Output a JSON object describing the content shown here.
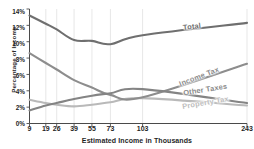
{
  "chart_data": {
    "type": "line",
    "title": "",
    "xlabel": "Estimated Income in Thousands",
    "ylabel": "Percentage of Income",
    "x": [
      9,
      19,
      26,
      39,
      55,
      73,
      103,
      243
    ],
    "xtick_labels": [
      "9",
      "19",
      "26",
      "39",
      "55",
      "73",
      "103",
      "243"
    ],
    "ytick_labels": [
      "0%",
      "2%",
      "4%",
      "6%",
      "8%",
      "10%",
      "12%",
      "14%"
    ],
    "ylim": [
      0,
      14
    ],
    "ytick_values": [
      0,
      2,
      4,
      6,
      8,
      10,
      12,
      14
    ],
    "grid": "vertical",
    "legend": "inline-series-labels",
    "series": [
      {
        "name": "Total",
        "color": "#6f6f6f",
        "values": [
          13.2,
          12.2,
          11.5,
          10.2,
          10.1,
          9.7,
          10.8,
          12.3
        ],
        "label_text": "Total"
      },
      {
        "name": "Income Tax",
        "color": "#8d8d8d",
        "values": [
          8.6,
          7.4,
          6.6,
          5.3,
          4.4,
          3.5,
          3.2,
          7.3
        ],
        "label_text": "Income Tax"
      },
      {
        "name": "Other Taxes",
        "color": "#848484",
        "values": [
          1.6,
          2.2,
          2.5,
          3.0,
          3.4,
          3.7,
          4.2,
          2.5
        ],
        "label_text": "Other Taxes"
      },
      {
        "name": "Property Tax",
        "color": "#b9b9b9",
        "values": [
          2.9,
          2.5,
          2.3,
          2.1,
          2.3,
          2.6,
          3.1,
          2.2
        ],
        "label_text": "Property Tax"
      }
    ]
  },
  "axis": {
    "ylabel": "Percentage of Income",
    "xlabel": "Estimated Income in Thousands",
    "yticks": [
      "14%",
      "12%",
      "10%",
      "8%",
      "6%",
      "4%",
      "2%",
      "0%"
    ],
    "xticks": [
      "9",
      "19",
      "26",
      "39",
      "55",
      "73",
      "103",
      "243"
    ]
  },
  "series_labels": {
    "total": "Total",
    "income_tax": "Income Tax",
    "other_taxes": "Other Taxes",
    "property_tax": "Property Tax"
  },
  "colors": {
    "total": "#6f6f6f",
    "income_tax": "#8d8d8d",
    "other_taxes": "#848484",
    "property_tax": "#b9b9b9",
    "axis": "#4a4a4a",
    "grid": "#dcdcdc",
    "text": "#1f1f1f"
  }
}
